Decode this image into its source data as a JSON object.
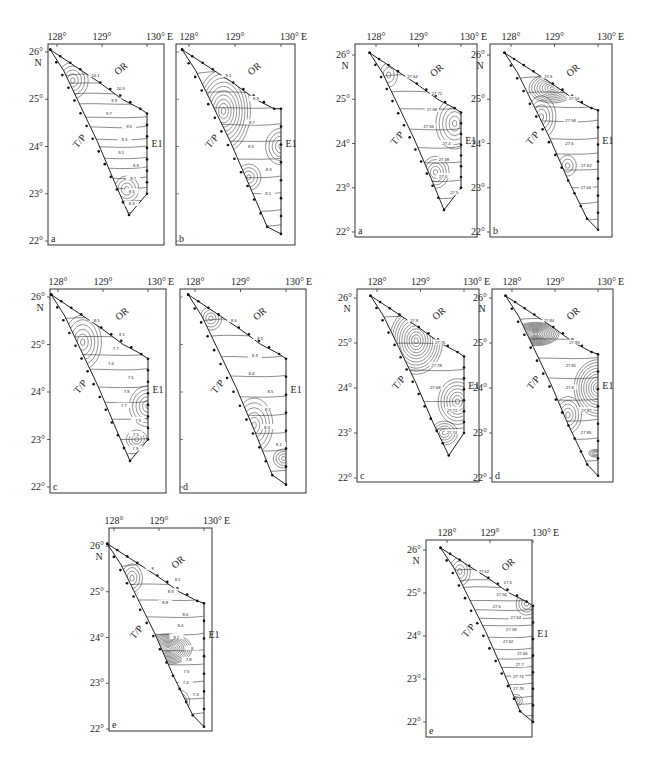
{
  "figure": {
    "axis": {
      "lon_ticks": [
        "128°",
        "129°",
        "130° E"
      ],
      "lat_ticks": [
        "26°",
        "25°",
        "24°",
        "23°",
        "22°"
      ],
      "lat_unit": "N"
    },
    "regions": {
      "north": "OR",
      "west": "T/P",
      "east": "E1"
    },
    "groups": [
      {
        "id": "left-row1",
        "panels": [
          {
            "letter": "a",
            "labels": [
              "10.1",
              "10.5",
              "9.9",
              "9.7",
              "9.5",
              "9.3",
              "9.1",
              "8.9",
              "8.7",
              "8.5",
              "8.3"
            ]
          },
          {
            "letter": "b",
            "labels": [
              "9.1",
              "8.9",
              "8.7",
              "8.5",
              "8.3",
              "8.1"
            ]
          }
        ]
      },
      {
        "id": "right-row1",
        "panels": [
          {
            "letter": "a",
            "labels": [
              "27.64",
              "27.72",
              "27.68",
              "27.56",
              "27.4",
              "27.48",
              "27.6",
              "27.5"
            ]
          },
          {
            "letter": "b",
            "labels": [
              "27.5",
              "27.54",
              "27.58",
              "27.6",
              "27.62",
              "27.64"
            ]
          }
        ]
      },
      {
        "id": "left-row2",
        "panels": [
          {
            "letter": "c",
            "labels": [
              "8.5",
              "8.1",
              "7.7",
              "7.6",
              "7.5",
              "7.8",
              "7.7",
              "7.3",
              "7.5",
              "7.9"
            ]
          },
          {
            "letter": "d",
            "labels": [
              "8.6",
              "8.5",
              "8.3",
              "8.4",
              "8.5",
              "8.2",
              "8.3",
              "8.1"
            ]
          }
        ]
      },
      {
        "id": "right-row2",
        "panels": [
          {
            "letter": "c",
            "labels": [
              "27.8",
              "27.76",
              "27.78",
              "27.68",
              "27.72",
              "27.74"
            ]
          },
          {
            "letter": "d",
            "labels": [
              "27.84",
              "27.83",
              "27.81",
              "27.8",
              "27.82",
              "27.85"
            ]
          }
        ]
      },
      {
        "id": "left-row3",
        "panels": [
          {
            "letter": "e",
            "labels": [
              "8",
              "8.1",
              "8.9",
              "8.8",
              "8.6",
              "8.4",
              "8.2",
              "8",
              "7.8",
              "7.5",
              "7.4",
              "7.3"
            ]
          }
        ]
      },
      {
        "id": "right-row3",
        "panels": [
          {
            "letter": "e",
            "labels": [
              "27.52",
              "27.5",
              "27.56",
              "27.6",
              "27.64",
              "27.58",
              "27.62",
              "27.66",
              "27.7",
              "27.74",
              "27.78"
            ]
          }
        ]
      }
    ]
  },
  "colors": {
    "background": "#ffffff",
    "ink": "#1e1e1e",
    "contour": "#2a2a2a"
  }
}
